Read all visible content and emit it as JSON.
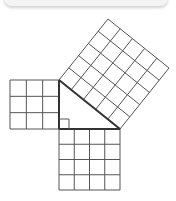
{
  "diagram": {
    "title": "",
    "colors": {
      "line": "#333333",
      "thin_line": "#555555",
      "background": "#ffffff",
      "panel": "#f4f4f4"
    },
    "triangle": {
      "vertices": {
        "top": [
          59,
          80
        ],
        "right_angle": [
          59,
          129
        ],
        "bottom_right": [
          120,
          129
        ]
      },
      "legs": [
        3,
        4
      ],
      "hypotenuse": 5
    },
    "squares": [
      {
        "name": "left-square",
        "side_units": 3,
        "cells": 9
      },
      {
        "name": "bottom-square",
        "side_units": 4,
        "cells": 16
      },
      {
        "name": "hypotenuse-square",
        "side_units": 5,
        "cells": 25
      }
    ],
    "right_angle_marker": true
  }
}
